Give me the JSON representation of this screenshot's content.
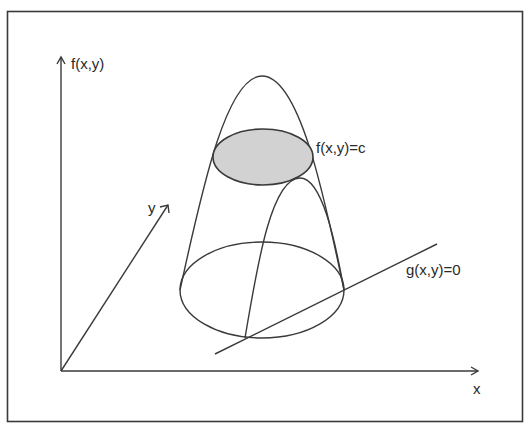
{
  "figure": {
    "colors": {
      "stroke": "#3a3a3a",
      "level_set_fill": "#d2d2d2",
      "frame": "#3a3a3a",
      "background": "#ffffff"
    }
  },
  "axes": {
    "vertical_label": "f(x,y)",
    "x_label": "x",
    "y_label": "y"
  },
  "annotations": {
    "level_set_label": "f(x,y)=c",
    "constraint_label": "g(x,y)=0"
  }
}
